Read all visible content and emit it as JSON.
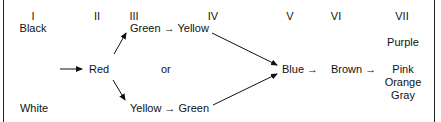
{
  "diagram": {
    "stages": [
      {
        "numeral": "I",
        "terms": [
          "Black",
          "White"
        ]
      },
      {
        "numeral": "II",
        "terms": [
          "Red"
        ]
      },
      {
        "numeral": "III",
        "terms": [
          "Green → Yellow",
          "Yellow → Green"
        ]
      },
      {
        "numeral": "IV",
        "terms": []
      },
      {
        "numeral": "V",
        "terms": [
          "Blue →"
        ]
      },
      {
        "numeral": "VI",
        "terms": [
          "Brown →"
        ]
      },
      {
        "numeral": "VII",
        "terms": [
          "Purple",
          "Pink",
          "Orange",
          "Gray"
        ]
      }
    ],
    "labels": {
      "n1": "I",
      "n2": "II",
      "n3": "III",
      "n4": "IV",
      "n5": "V",
      "n6": "VI",
      "n7": "VII",
      "black": "Black",
      "white": "White",
      "red": "Red",
      "green_yellow": "Green → Yellow",
      "or": "or",
      "yellow_green": "Yellow → Green",
      "blue": "Blue →",
      "brown": "Brown →",
      "purple": "Purple",
      "pink": "Pink",
      "orange": "Orange",
      "gray": "Gray"
    },
    "colors": {
      "ink": "#111111",
      "background": "#ffffff",
      "frame": "#222222"
    }
  }
}
